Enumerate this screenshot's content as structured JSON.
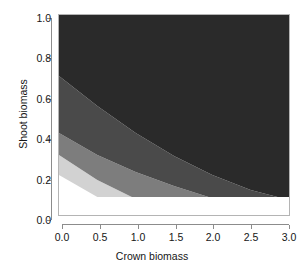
{
  "chart_data": {
    "type": "heatmap",
    "title": "",
    "xlabel": "Crown biomass",
    "ylabel": "Shoot biomass",
    "xlim": [
      0.0,
      3.0
    ],
    "ylim": [
      0.0,
      1.0
    ],
    "xticks": [
      "0.0",
      "0.5",
      "1.0",
      "1.5",
      "2.0",
      "2.5",
      "3.0"
    ],
    "yticks": [
      "0.0",
      "0.2",
      "0.4",
      "0.6",
      "0.8",
      "1.0"
    ],
    "grid": false,
    "legend": "none",
    "band_colors": [
      "#d2d2d2",
      "#7d7d7d",
      "#4a4a4a",
      "#2a2a2a"
    ],
    "background_color": "#ffffff",
    "frame_color": "#b4b4b4",
    "axis_color": "#8c8c8c",
    "lower_cutoff_y": 0.09,
    "bands": [
      {
        "index": 1,
        "name": "lightest",
        "color": "#d2d2d2",
        "upper_boundary": [
          [
            0.0,
            0.3
          ],
          [
            0.5,
            0.175
          ],
          [
            0.95,
            0.09
          ]
        ],
        "lower_boundary": [
          [
            0.0,
            0.2
          ],
          [
            0.5,
            0.09
          ]
        ]
      },
      {
        "index": 2,
        "name": "light-mid",
        "color": "#7d7d7d",
        "upper_boundary": [
          [
            0.0,
            0.41
          ],
          [
            0.5,
            0.3
          ],
          [
            1.0,
            0.215
          ],
          [
            1.5,
            0.145
          ],
          [
            1.95,
            0.09
          ]
        ],
        "lower_boundary": [
          [
            0.0,
            0.3
          ],
          [
            0.5,
            0.175
          ],
          [
            0.95,
            0.09
          ]
        ]
      },
      {
        "index": 3,
        "name": "dark-mid",
        "color": "#4a4a4a",
        "upper_boundary": [
          [
            0.0,
            0.695
          ],
          [
            0.5,
            0.545
          ],
          [
            1.0,
            0.41
          ],
          [
            1.5,
            0.295
          ],
          [
            2.0,
            0.2
          ],
          [
            2.5,
            0.125
          ],
          [
            2.85,
            0.09
          ]
        ],
        "lower_boundary": [
          [
            0.0,
            0.41
          ],
          [
            0.5,
            0.3
          ],
          [
            1.0,
            0.215
          ],
          [
            1.5,
            0.145
          ],
          [
            1.95,
            0.09
          ]
        ]
      },
      {
        "index": 4,
        "name": "darkest",
        "color": "#2a2a2a",
        "upper_boundary": [
          [
            0.0,
            1.0
          ],
          [
            3.0,
            1.0
          ]
        ],
        "lower_boundary": [
          [
            0.0,
            0.695
          ],
          [
            0.5,
            0.545
          ],
          [
            1.0,
            0.41
          ],
          [
            1.5,
            0.295
          ],
          [
            2.0,
            0.2
          ],
          [
            2.5,
            0.125
          ],
          [
            2.85,
            0.09
          ],
          [
            3.0,
            0.09
          ]
        ]
      }
    ]
  }
}
